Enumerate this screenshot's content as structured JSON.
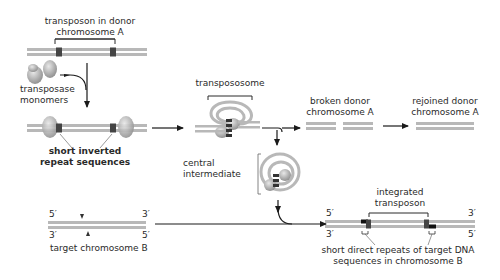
{
  "diagram": {
    "type": "DNA transposition (cut-and-paste) mechanism",
    "labels": {
      "transposon_donor": [
        "transposon in donor",
        "chromosome A"
      ],
      "transposase_monomers": [
        "transposase",
        "monomers"
      ],
      "inverted_repeats": [
        "short inverted",
        "repeat sequences"
      ],
      "transpososome": "transpososome",
      "broken_donor": [
        "broken donor",
        "chromosome A"
      ],
      "rejoined_donor": [
        "rejoined donor",
        "chromosome A"
      ],
      "central_intermediate": [
        "central",
        "intermediate"
      ],
      "target_chromosome": "target chromosome B",
      "integrated_transposon": [
        "integrated",
        "transposon"
      ],
      "direct_repeats": [
        "short direct repeats of target DNA",
        "sequences in chromosome B"
      ],
      "five_prime": "5′",
      "three_prime": "3′"
    },
    "colors": {
      "dna_strand": "#b8b8b8",
      "repeat_mark": "#333333",
      "protein": "#a8a8a8",
      "arrow": "#1a1a1a",
      "text": "#2a2a2a"
    }
  }
}
